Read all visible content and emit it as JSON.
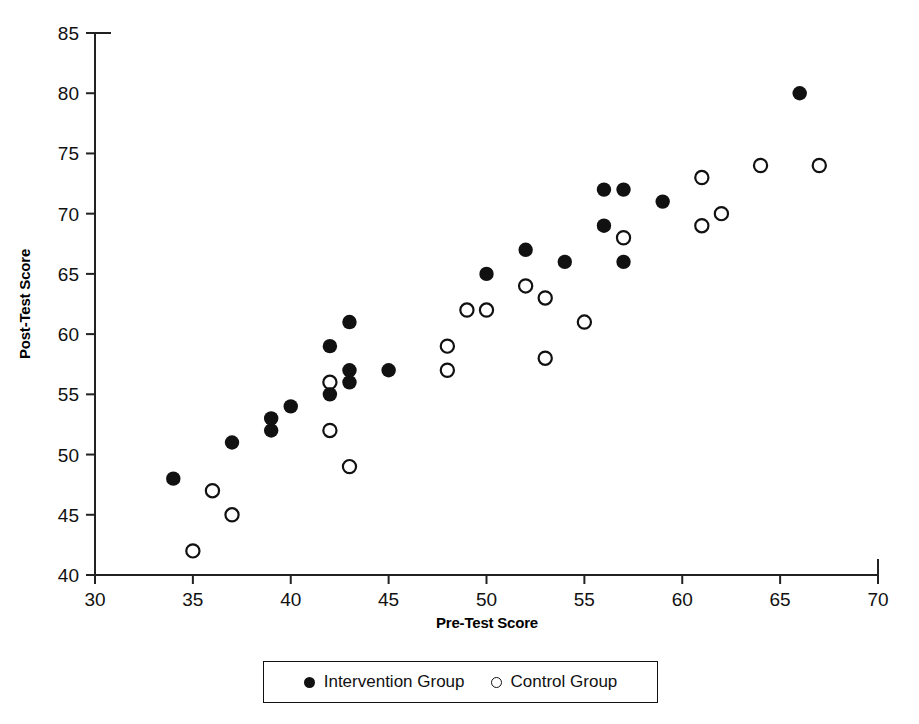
{
  "chart_data": {
    "type": "scatter",
    "title": "",
    "xlabel": "Pre-Test Score",
    "ylabel": "Post-Test Score",
    "xlim": [
      30,
      70
    ],
    "ylim": [
      40,
      85
    ],
    "xticks": [
      30,
      35,
      40,
      45,
      50,
      55,
      60,
      65,
      70
    ],
    "yticks": [
      40,
      45,
      50,
      55,
      60,
      65,
      70,
      75,
      80,
      85
    ],
    "grid": false,
    "legend_position": "bottom-center",
    "series": [
      {
        "name": "Intervention Group",
        "marker": "filled-circle",
        "color": "#111111",
        "points": [
          [
            34,
            48
          ],
          [
            37,
            51
          ],
          [
            39,
            52
          ],
          [
            39,
            53
          ],
          [
            40,
            54
          ],
          [
            42,
            55
          ],
          [
            42,
            59
          ],
          [
            43,
            56
          ],
          [
            43,
            57
          ],
          [
            43,
            61
          ],
          [
            45,
            57
          ],
          [
            50,
            65
          ],
          [
            52,
            67
          ],
          [
            54,
            66
          ],
          [
            56,
            69
          ],
          [
            56,
            72
          ],
          [
            57,
            66
          ],
          [
            57,
            72
          ],
          [
            59,
            71
          ],
          [
            66,
            80
          ]
        ]
      },
      {
        "name": "Control Group",
        "marker": "open-circle",
        "color": "#111111",
        "points": [
          [
            35,
            42
          ],
          [
            36,
            47
          ],
          [
            37,
            45
          ],
          [
            42,
            52
          ],
          [
            42,
            56
          ],
          [
            43,
            49
          ],
          [
            48,
            57
          ],
          [
            48,
            59
          ],
          [
            49,
            62
          ],
          [
            50,
            62
          ],
          [
            52,
            64
          ],
          [
            53,
            58
          ],
          [
            53,
            63
          ],
          [
            55,
            61
          ],
          [
            57,
            68
          ],
          [
            61,
            69
          ],
          [
            61,
            73
          ],
          [
            62,
            70
          ],
          [
            64,
            74
          ],
          [
            67,
            74
          ]
        ]
      }
    ]
  },
  "axes": {
    "x_label": "Pre-Test Score",
    "y_label": "Post-Test Score",
    "x_tick_labels": [
      "30",
      "35",
      "40",
      "45",
      "50",
      "55",
      "60",
      "65",
      "70"
    ],
    "y_tick_labels": [
      "40",
      "45",
      "50",
      "55",
      "60",
      "65",
      "70",
      "75",
      "80",
      "85"
    ]
  },
  "legend": {
    "items": [
      {
        "label": "Intervention Group",
        "marker": "filled-circle"
      },
      {
        "label": "Control Group",
        "marker": "open-circle"
      }
    ]
  },
  "style": {
    "axis_color": "#222222",
    "marker_color": "#111111",
    "background": "#ffffff"
  }
}
